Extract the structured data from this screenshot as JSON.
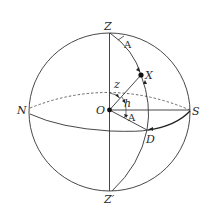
{
  "diagram": {
    "colors": {
      "stroke": "#333333",
      "background": "#ffffff"
    },
    "points": {
      "zenith": "Z",
      "nadir": "Z′",
      "observer": "O",
      "north": "N",
      "south": "S",
      "star": "X",
      "horizon_foot": "D"
    },
    "angles": {
      "azimuth_top": "A",
      "azimuth_bottom": "A",
      "zenith_distance": "z",
      "altitude": "h"
    }
  }
}
